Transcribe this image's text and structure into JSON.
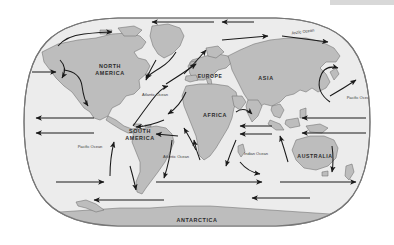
{
  "map": {
    "title": "World Ocean Surface Currents Map",
    "projection": "robinson",
    "colors": {
      "page_background": "#ffffff",
      "ocean": "#ececec",
      "land": "#bdbdbd",
      "land_outline": "#6e6e6e",
      "frame": "#777777",
      "arrow": "#1a1a1a",
      "label_text": "#2b2b2b",
      "top_strip": "#d8d8d8"
    },
    "continent_labels": [
      {
        "id": "north-america",
        "text": "NORTH\nAMERICA",
        "line1": "NORTH",
        "line2": "AMERICA",
        "x": 110,
        "y": 68,
        "size": 5.4
      },
      {
        "id": "south-america",
        "text": "SOUTH\nAMERICA",
        "line1": "SOUTH",
        "line2": "AMERICA",
        "x": 140,
        "y": 133,
        "size": 5.4
      },
      {
        "id": "europe",
        "text": "EUROPE",
        "line1": "EUROPE",
        "line2": "",
        "x": 210,
        "y": 78,
        "size": 5.0
      },
      {
        "id": "africa",
        "text": "AFRICA",
        "line1": "AFRICA",
        "line2": "",
        "x": 215,
        "y": 117,
        "size": 5.4
      },
      {
        "id": "asia",
        "text": "ASIA",
        "line1": "ASIA",
        "line2": "",
        "x": 266,
        "y": 80,
        "size": 5.4
      },
      {
        "id": "australia",
        "text": "AUSTRALIA",
        "line1": "AUSTRALIA",
        "line2": "",
        "x": 315,
        "y": 158,
        "size": 5.2
      },
      {
        "id": "antarctica",
        "text": "ANTARCTICA",
        "line1": "ANTARCTICA",
        "line2": "",
        "x": 197,
        "y": 222,
        "size": 5.4
      }
    ],
    "ocean_labels": [
      {
        "id": "arctic-ocean",
        "text": "Arctic Ocean",
        "x": 303,
        "y": 33,
        "size": 4.0,
        "rotate": -8
      },
      {
        "id": "north-atlantic-ocean",
        "text": "Atlantic Ocean",
        "x": 155,
        "y": 96,
        "size": 4.0,
        "rotate": 0
      },
      {
        "id": "south-atlantic-ocean",
        "text": "Atlantic Ocean",
        "x": 176,
        "y": 158,
        "size": 4.0,
        "rotate": 0
      },
      {
        "id": "south-pacific-ocean",
        "text": "Pacific Ocean",
        "x": 90,
        "y": 148,
        "size": 4.0,
        "rotate": 0
      },
      {
        "id": "east-pacific-ocean",
        "text": "Pacific Ocean",
        "x": 359,
        "y": 99,
        "size": 4.0,
        "rotate": 0
      },
      {
        "id": "indian-ocean",
        "text": "Indian Ocean",
        "x": 256,
        "y": 155,
        "size": 4.0,
        "rotate": 0
      }
    ],
    "legend_note": "Arrows indicate direction of major ocean surface currents"
  }
}
